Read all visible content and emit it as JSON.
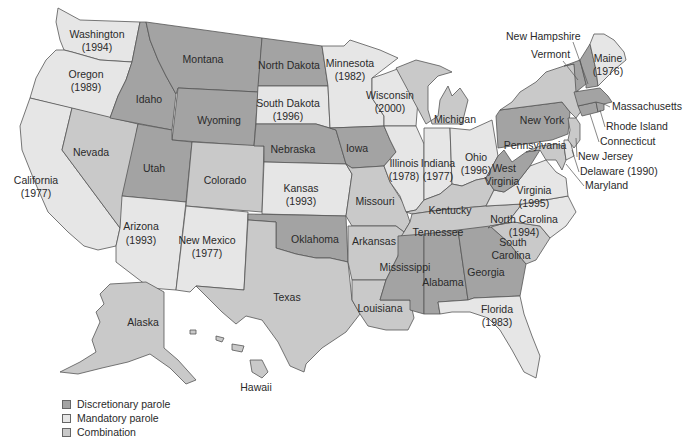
{
  "legend": {
    "items": [
      {
        "key": "discretionary",
        "label": "Discretionary parole",
        "color": "#a3a3a3"
      },
      {
        "key": "mandatory",
        "label": "Mandatory parole",
        "color": "#e6e6e6"
      },
      {
        "key": "combination",
        "label": "Combination",
        "color": "#c9c9c9"
      }
    ]
  },
  "colors": {
    "discretionary": "#a3a3a3",
    "mandatory": "#e6e6e6",
    "combination": "#c9c9c9",
    "border": "#555555",
    "text": "#2a2a2a"
  },
  "states": {
    "washington": {
      "name": "Washington",
      "year": "(1994)",
      "category": "mandatory"
    },
    "oregon": {
      "name": "Oregon",
      "year": "(1989)",
      "category": "mandatory"
    },
    "california": {
      "name": "California",
      "year": "(1977)",
      "category": "mandatory"
    },
    "nevada": {
      "name": "Nevada",
      "category": "combination"
    },
    "idaho": {
      "name": "Idaho",
      "category": "discretionary"
    },
    "montana": {
      "name": "Montana",
      "category": "discretionary"
    },
    "wyoming": {
      "name": "Wyoming",
      "category": "discretionary"
    },
    "utah": {
      "name": "Utah",
      "category": "discretionary"
    },
    "arizona": {
      "name": "Arizona",
      "year": "(1993)",
      "category": "mandatory"
    },
    "colorado": {
      "name": "Colorado",
      "category": "combination"
    },
    "new_mexico": {
      "name": "New Mexico",
      "year": "(1977)",
      "category": "mandatory"
    },
    "north_dakota": {
      "name": "North Dakota",
      "category": "discretionary"
    },
    "south_dakota": {
      "name": "South Dakota",
      "year": "(1996)",
      "category": "mandatory"
    },
    "nebraska": {
      "name": "Nebraska",
      "category": "discretionary"
    },
    "kansas": {
      "name": "Kansas",
      "year": "(1993)",
      "category": "mandatory"
    },
    "oklahoma": {
      "name": "Oklahoma",
      "category": "discretionary"
    },
    "texas": {
      "name": "Texas",
      "category": "combination"
    },
    "minnesota": {
      "name": "Minnesota",
      "year": "(1982)",
      "category": "mandatory"
    },
    "iowa": {
      "name": "Iowa",
      "category": "discretionary"
    },
    "missouri": {
      "name": "Missouri",
      "category": "combination"
    },
    "arkansas": {
      "name": "Arkansas",
      "category": "combination"
    },
    "louisiana": {
      "name": "Louisiana",
      "category": "combination"
    },
    "wisconsin": {
      "name": "Wisconsin",
      "year": "(2000)",
      "category": "mandatory"
    },
    "illinois": {
      "name": "Illinois",
      "year": "(1978)",
      "category": "mandatory"
    },
    "michigan": {
      "name": "Michigan",
      "category": "combination"
    },
    "indiana": {
      "name": "Indiana",
      "year": "(1977)",
      "category": "mandatory"
    },
    "ohio": {
      "name": "Ohio",
      "year": "(1996)",
      "category": "mandatory"
    },
    "kentucky": {
      "name": "Kentucky",
      "category": "combination"
    },
    "tennessee": {
      "name": "Tennessee",
      "category": "combination"
    },
    "mississippi": {
      "name": "Mississippi",
      "category": "discretionary"
    },
    "alabama": {
      "name": "Alabama",
      "category": "discretionary"
    },
    "georgia": {
      "name": "Georgia",
      "category": "discretionary"
    },
    "florida": {
      "name": "Florida",
      "year": "(1983)",
      "category": "mandatory"
    },
    "south_carolina": {
      "name": "South Carolina",
      "category": "combination"
    },
    "north_carolina": {
      "name": "North Carolina",
      "year": "(1994)",
      "category": "mandatory"
    },
    "virginia": {
      "name": "Virginia",
      "year": "(1995)",
      "category": "mandatory"
    },
    "west_virginia": {
      "name": "West Virginia",
      "category": "discretionary"
    },
    "pennsylvania": {
      "name": "Pennsylvania",
      "category": "discretionary"
    },
    "new_york": {
      "name": "New York",
      "category": "combination"
    },
    "vermont": {
      "name": "Vermont",
      "category": "discretionary"
    },
    "new_hampshire": {
      "name": "New Hampshire",
      "category": "discretionary"
    },
    "maine": {
      "name": "Maine",
      "year": "(1976)",
      "category": "mandatory"
    },
    "massachusetts": {
      "name": "Massachusetts",
      "category": "discretionary"
    },
    "rhode_island": {
      "name": "Rhode Island",
      "category": "discretionary"
    },
    "connecticut": {
      "name": "Connecticut",
      "category": "discretionary"
    },
    "new_jersey": {
      "name": "New Jersey",
      "category": "combination"
    },
    "delaware": {
      "name": "Delaware (1990)",
      "category": "mandatory"
    },
    "maryland": {
      "name": "Maryland",
      "category": "combination"
    },
    "alaska": {
      "name": "Alaska",
      "category": "combination"
    },
    "hawaii": {
      "name": "Hawaii",
      "category": "combination"
    }
  }
}
